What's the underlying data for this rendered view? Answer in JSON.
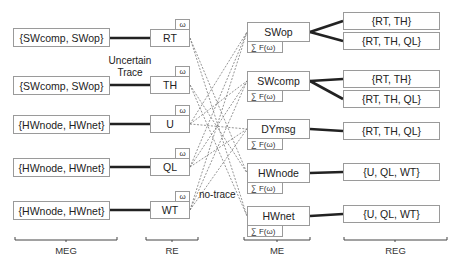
{
  "diagram": {
    "columns": {
      "meg": "MEG",
      "re": "RE",
      "me": "ME",
      "reg": "REG"
    },
    "meg_boxes": [
      {
        "label": "{SWcomp, SWop}"
      },
      {
        "label": "{SWcomp, SWop}"
      },
      {
        "label": "{HWnode, HWnet}"
      },
      {
        "label": "{HWnode, HWnet}"
      },
      {
        "label": "{HWnode, HWnet}"
      }
    ],
    "re_boxes": [
      {
        "label": "RT",
        "tab": "ω"
      },
      {
        "label": "TH",
        "tab": "ω"
      },
      {
        "label": "U",
        "tab": "ω"
      },
      {
        "label": "QL",
        "tab": "ω"
      },
      {
        "label": "WT",
        "tab": "ω"
      }
    ],
    "me_boxes": [
      {
        "label": "SWop",
        "sum": "∑ F(ω)"
      },
      {
        "label": "SWcomp",
        "sum": "∑ F(ω)"
      },
      {
        "label": "DYmsg",
        "sum": "∑ F(ω)"
      },
      {
        "label": "HWnode",
        "sum": "∑ F(ω)"
      },
      {
        "label": "HWnet",
        "sum": "∑ F(ω)"
      }
    ],
    "reg_boxes": [
      {
        "label": "{RT, TH}"
      },
      {
        "label": "{RT, TH, QL}"
      },
      {
        "label": "{RT, TH}"
      },
      {
        "label": "{RT, TH, QL}"
      },
      {
        "label": "{RT, TH, QL}"
      },
      {
        "label": "{U, QL, WT}"
      },
      {
        "label": "{U, QL, WT}"
      }
    ],
    "annotations": {
      "uncertain_trace_line1": "Uncertain",
      "uncertain_trace_line2": "Trace",
      "no_trace": "no-trace"
    },
    "colors": {
      "border": "#9a9a9a",
      "solid_link": "#222222",
      "dashed_link": "#7a7a7a"
    }
  }
}
